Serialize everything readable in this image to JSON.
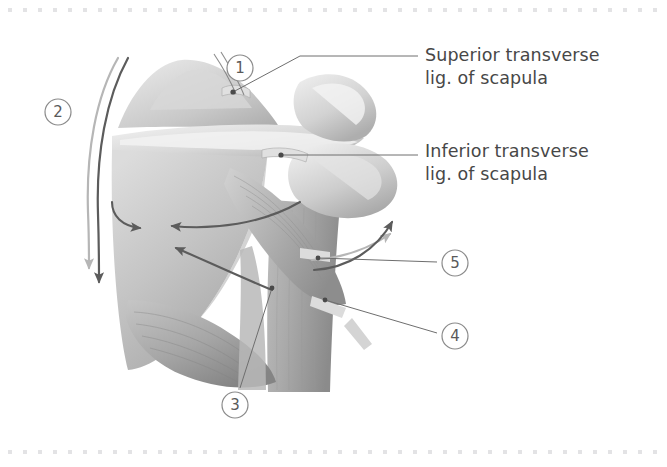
{
  "figure": {
    "kind": "anatomical-illustration",
    "background_color": "#ffffff",
    "border": {
      "style": "dotted",
      "dot_color": "#e3e3e5",
      "dot_size": 4,
      "dot_spacing": 15,
      "top_y": 9,
      "bottom_y": 451
    },
    "palette": {
      "text": "#474747",
      "leader_line": "#6e6e6e",
      "circle_stroke": "#8a8a8a",
      "circle_text": "#5a5a5a",
      "arrow_dark": "#5c5c5c",
      "arrow_light": "#b4b4b4",
      "bone_light": "#e9e9e9",
      "bone_mid": "#cfcfcf",
      "bone_shadow": "#a8a8a8",
      "muscle_mid": "#bcbcbc",
      "muscle_dark": "#8f8f8f"
    }
  },
  "labels": [
    {
      "id": "superior",
      "name": "superior-transverse-ligament",
      "text": "Superior transverse\nlig. of scapula",
      "leader": {
        "from_x": 395,
        "from_y": 56,
        "to_x": 233,
        "to_y": 92
      },
      "dot": {
        "x": 233,
        "y": 92
      }
    },
    {
      "id": "inferior",
      "name": "inferior-transverse-ligament",
      "text": "Inferior transverse\nlig. of scapula",
      "leader": {
        "from_x": 395,
        "from_y": 155,
        "to_x": 281,
        "to_y": 155
      },
      "dot": {
        "x": 281,
        "y": 155
      }
    }
  ],
  "callouts": [
    {
      "id": "1",
      "label": "1",
      "cx": 240,
      "cy": 68,
      "r": 13
    },
    {
      "id": "2",
      "label": "2",
      "cx": 58,
      "cy": 112,
      "r": 13
    },
    {
      "id": "3",
      "label": "3",
      "cx": 235,
      "cy": 405,
      "r": 13
    },
    {
      "id": "4",
      "label": "4",
      "cx": 455,
      "cy": 336,
      "r": 13
    },
    {
      "id": "5",
      "label": "5",
      "cx": 455,
      "cy": 263,
      "r": 13
    }
  ],
  "callout_leaders": [
    {
      "for": "3",
      "from_x": 240,
      "from_y": 388,
      "to_x": 272,
      "to_y": 288
    },
    {
      "for": "4",
      "from_x": 437,
      "from_y": 333,
      "to_x": 325,
      "to_y": 300
    },
    {
      "for": "5",
      "from_x": 437,
      "from_y": 262,
      "to_x": 318,
      "to_y": 258
    }
  ],
  "motion_arrows": [
    {
      "id": "bracket-dark",
      "tone": "dark",
      "note": "long curved line down left border of scapula ending in downward arrowhead"
    },
    {
      "id": "bracket-light",
      "tone": "light",
      "note": "parallel light curved line ending in downward arrowhead"
    },
    {
      "id": "spine-arrow-outer",
      "tone": "dark",
      "note": "curved arrow pointing left toward spine of scapula"
    },
    {
      "id": "spine-arrow-inner",
      "tone": "dark",
      "note": "curved arrow pointing left along scapular spine"
    },
    {
      "id": "infraspinous-arrow",
      "tone": "dark",
      "note": "curved arrow pointing up-left into infraspinous fossa"
    },
    {
      "id": "humerus-arrow-dark",
      "tone": "dark",
      "note": "curved arrow pointing up-right along humerus"
    },
    {
      "id": "humerus-arrow-light",
      "tone": "light",
      "note": "light curved arrow pointing up-right along humerus"
    }
  ]
}
